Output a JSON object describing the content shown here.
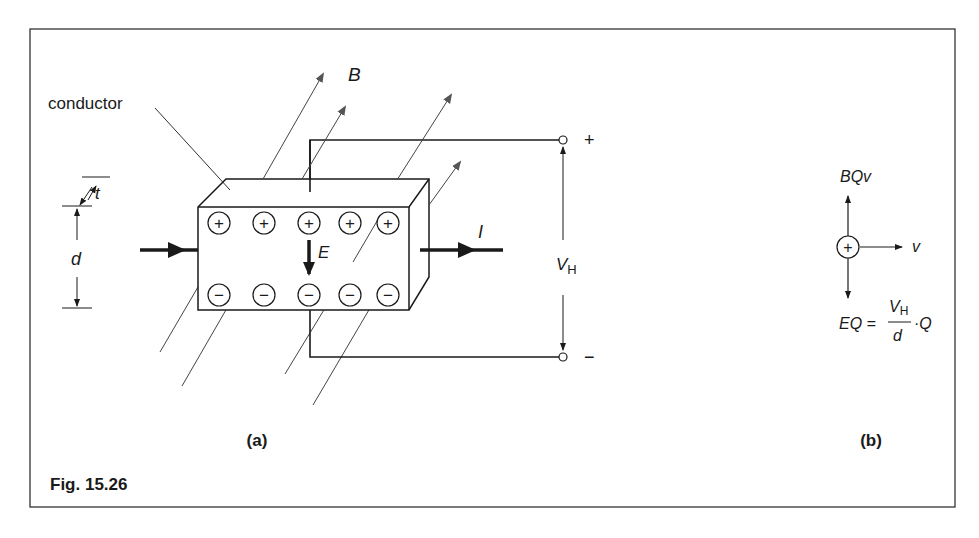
{
  "figure": {
    "caption": "Fig. 15.26",
    "panel_a_label": "(a)",
    "panel_b_label": "(b)"
  },
  "panel_a": {
    "conductor_label": "conductor",
    "field_label": "B",
    "current_label": "I",
    "efield_label": "E",
    "thickness_label": "t",
    "height_label": "d",
    "hall_voltage_symbol": "V",
    "hall_voltage_subscript": "H",
    "plus_terminal": "+",
    "minus_terminal": "−",
    "positive_charges": [
      "+",
      "+",
      "+",
      "+",
      "+"
    ],
    "negative_charges": [
      "−",
      "−",
      "−",
      "−",
      "−"
    ]
  },
  "panel_b": {
    "magnetic_force_label": "BQv",
    "velocity_label": "v",
    "charge_symbol": "+",
    "equation_lhs": "EQ =",
    "equation_num_symbol": "V",
    "equation_num_subscript": "H",
    "equation_den": "d",
    "equation_rhs": "·Q"
  },
  "colors": {
    "ink": "#1a1a1a",
    "field_arrow": "#555555",
    "background": "#ffffff"
  }
}
